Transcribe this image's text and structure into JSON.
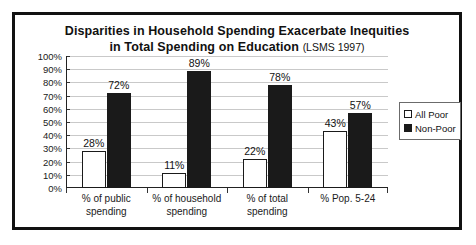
{
  "chart_data": {
    "type": "bar",
    "title": "Disparities in Household Spending Exacerbate Inequities in Total Spending on Education (LSMS 1997)",
    "title_line1": "Disparities in Household Spending Exacerbate Inequities",
    "title_line2": "in Total Spending on Education",
    "title_source": "(LSMS 1997)",
    "xlabel": "",
    "ylabel": "",
    "ylim": [
      0,
      100
    ],
    "grid": true,
    "legend_position": "right",
    "categories": [
      "% of public spending",
      "% of household spending",
      "% of total spending",
      "% Pop. 5-24"
    ],
    "category_lines": [
      [
        "% of public",
        "spending"
      ],
      [
        "% of household",
        "spending"
      ],
      [
        "% of total",
        "spending"
      ],
      [
        "% Pop. 5-24",
        ""
      ]
    ],
    "series": [
      {
        "name": "All Poor",
        "color": "#ffffff",
        "values": [
          28,
          11,
          22,
          43
        ],
        "labels": [
          "28%",
          "11%",
          "22%",
          "43%"
        ]
      },
      {
        "name": "Non-Poor",
        "color": "#1a1a1a",
        "values": [
          72,
          89,
          78,
          57
        ],
        "labels": [
          "72%",
          "89%",
          "78%",
          "57%"
        ]
      }
    ],
    "y_ticks": [
      0,
      10,
      20,
      30,
      40,
      50,
      60,
      70,
      80,
      90,
      100
    ],
    "y_tick_labels": [
      "0%",
      "10%",
      "20%",
      "30%",
      "40%",
      "50%",
      "60%",
      "70%",
      "80%",
      "90%",
      "100%"
    ]
  },
  "legend": {
    "items": [
      {
        "label": "All Poor",
        "swatch": "white-square-icon"
      },
      {
        "label": "Non-Poor",
        "swatch": "black-square-icon"
      }
    ]
  },
  "colors": {
    "all_poor": "#ffffff",
    "non_poor": "#1a1a1a",
    "frame": "#111111",
    "gridline": "#c9c9c9",
    "axis": "#222222"
  }
}
